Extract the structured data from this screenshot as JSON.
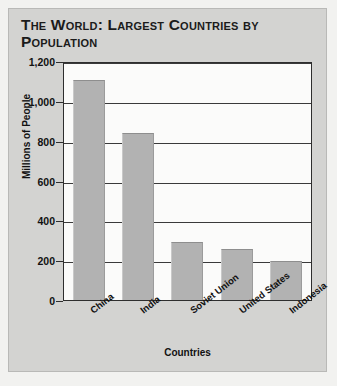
{
  "figure": {
    "title": "The World: Largest Countries by Population",
    "background_color": "#d3d3d1",
    "plot_background_color": "#fbfbfa",
    "bar_color": "#b2b2b2",
    "gridline_color": "#3a3a3a",
    "axis_color": "#2e2e2e"
  },
  "chart_data": {
    "type": "bar",
    "title": "The World: Largest Countries by Population",
    "xlabel": "Countries",
    "ylabel": "Millions of People",
    "categories": [
      "China",
      "India",
      "Soviet Union",
      "United States",
      "Indonesia"
    ],
    "values": [
      1105,
      840,
      290,
      255,
      195
    ],
    "ylim": [
      0,
      1200
    ],
    "yticks": [
      0,
      200,
      400,
      600,
      800,
      1000,
      1200
    ],
    "ytick_labels": [
      "0",
      "200",
      "400",
      "600",
      "800",
      "1,000",
      "1,200"
    ],
    "grid": true,
    "grid_axis": "y",
    "legend": false,
    "xtick_rotation": -38
  }
}
